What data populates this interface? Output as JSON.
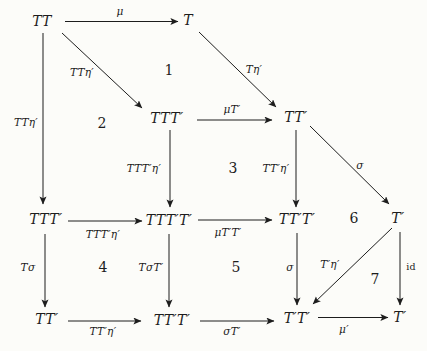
{
  "colors": {
    "background": "#fcfcf9",
    "ink": "#1d1d1d"
  },
  "diagram": {
    "nodes": [
      {
        "id": "TT-top",
        "label": "TT",
        "x": 42,
        "y": 21
      },
      {
        "id": "T-top",
        "label": "T",
        "x": 188,
        "y": 20
      },
      {
        "id": "TTTp-mid",
        "label": "TTT′",
        "x": 167,
        "y": 118
      },
      {
        "id": "TTp-mid",
        "label": "TT′",
        "x": 296,
        "y": 117
      },
      {
        "id": "TTTp-left",
        "label": "TTT′",
        "x": 46,
        "y": 219
      },
      {
        "id": "TTTpTp-mid",
        "label": "TTT′T′",
        "x": 169,
        "y": 220
      },
      {
        "id": "TTpTp-right",
        "label": "TT′T′",
        "x": 297,
        "y": 219
      },
      {
        "id": "Tp-right",
        "label": "T′",
        "x": 398,
        "y": 218
      },
      {
        "id": "TTp-bottom",
        "label": "TT′",
        "x": 47,
        "y": 319
      },
      {
        "id": "TTpTp-bottom",
        "label": "TT′T′",
        "x": 172,
        "y": 320
      },
      {
        "id": "TpTp-bottom",
        "label": "T′T′",
        "x": 297,
        "y": 318
      },
      {
        "id": "Tp-bottom",
        "label": "T′",
        "x": 400,
        "y": 317
      }
    ],
    "arrows": [
      {
        "name": "mu-top",
        "label": "μ",
        "style": "alabel",
        "x1": 65,
        "y1": 21.5,
        "x2": 178,
        "y2": 21.5,
        "lx": 120,
        "ly": 11
      },
      {
        "name": "TTeta-diagonal",
        "label": "TTη′",
        "style": "alabel",
        "x1": 62,
        "y1": 33,
        "x2": 142,
        "y2": 108,
        "lx": 82,
        "ly": 72
      },
      {
        "name": "Teta-diagonal",
        "label": "Tη′",
        "style": "alabel",
        "x1": 199,
        "y1": 32,
        "x2": 276,
        "y2": 107,
        "lx": 254,
        "ly": 69
      },
      {
        "name": "TTeta-left-vertical",
        "label": "TTη′",
        "style": "alabel",
        "x1": 43,
        "y1": 33,
        "x2": 43,
        "y2": 204,
        "lx": 26,
        "ly": 122
      },
      {
        "name": "muTp-mid",
        "label": "μT′",
        "style": "alabel",
        "x1": 197,
        "y1": 120,
        "x2": 272,
        "y2": 120,
        "lx": 232,
        "ly": 109
      },
      {
        "name": "TTTpeta-vertical",
        "label": "TTT′η′",
        "style": "alabel",
        "x1": 170,
        "y1": 130,
        "x2": 170,
        "y2": 207,
        "lx": 144,
        "ly": 168
      },
      {
        "name": "TTpeta-vertical",
        "label": "TT′η′",
        "style": "alabel",
        "x1": 296,
        "y1": 130,
        "x2": 296,
        "y2": 207,
        "lx": 276,
        "ly": 168
      },
      {
        "name": "sigma-diagonal",
        "label": "σ",
        "style": "alabel",
        "x1": 310,
        "y1": 126,
        "x2": 389,
        "y2": 204,
        "lx": 360,
        "ly": 165
      },
      {
        "name": "TTTpeta-horizontal",
        "label": "TTT′η′",
        "style": "alabel",
        "x1": 68,
        "y1": 221,
        "x2": 142,
        "y2": 221,
        "lx": 103,
        "ly": 234
      },
      {
        "name": "muTpTp-horizontal",
        "label": "μT′T′",
        "style": "alabel",
        "x1": 198,
        "y1": 220,
        "x2": 272,
        "y2": 220,
        "lx": 228,
        "ly": 232
      },
      {
        "name": "Tsigma-vertical",
        "label": "Tσ",
        "style": "alabel",
        "x1": 45,
        "y1": 234,
        "x2": 45,
        "y2": 307,
        "lx": 28,
        "ly": 267
      },
      {
        "name": "TsigmaTp-vertical",
        "label": "TσT′",
        "style": "alabel",
        "x1": 169,
        "y1": 234,
        "x2": 169,
        "y2": 307,
        "lx": 151,
        "ly": 267
      },
      {
        "name": "sigma-vertical",
        "label": "σ",
        "style": "alabel",
        "x1": 297,
        "y1": 233,
        "x2": 297,
        "y2": 305,
        "lx": 290,
        "ly": 267
      },
      {
        "name": "Tpeta-diagonal",
        "label": "T′η′",
        "style": "alabel",
        "x1": 392,
        "y1": 228,
        "x2": 313,
        "y2": 304,
        "lx": 330,
        "ly": 264
      },
      {
        "name": "id-vertical",
        "label": "id",
        "style": "roman",
        "x1": 400,
        "y1": 232,
        "x2": 400,
        "y2": 305,
        "lx": 411,
        "ly": 266
      },
      {
        "name": "TTpeta-bottom",
        "label": "TT′η′",
        "style": "alabel",
        "x1": 68,
        "y1": 321,
        "x2": 141,
        "y2": 321,
        "lx": 103,
        "ly": 331
      },
      {
        "name": "sigmaTp-bottom",
        "label": "σT′",
        "style": "alabel",
        "x1": 200,
        "y1": 321,
        "x2": 274,
        "y2": 321,
        "lx": 232,
        "ly": 331
      },
      {
        "name": "mup-bottom",
        "label": "μ′",
        "style": "alabel",
        "x1": 318,
        "y1": 317.5,
        "x2": 388,
        "y2": 317.5,
        "lx": 344,
        "ly": 329
      }
    ],
    "regions": [
      {
        "label": "1",
        "x": 169,
        "y": 70
      },
      {
        "label": "2",
        "x": 102,
        "y": 123
      },
      {
        "label": "3",
        "x": 233,
        "y": 168
      },
      {
        "label": "4",
        "x": 103,
        "y": 267
      },
      {
        "label": "5",
        "x": 236,
        "y": 267
      },
      {
        "label": "6",
        "x": 354,
        "y": 218
      },
      {
        "label": "7",
        "x": 375,
        "y": 279
      }
    ]
  }
}
